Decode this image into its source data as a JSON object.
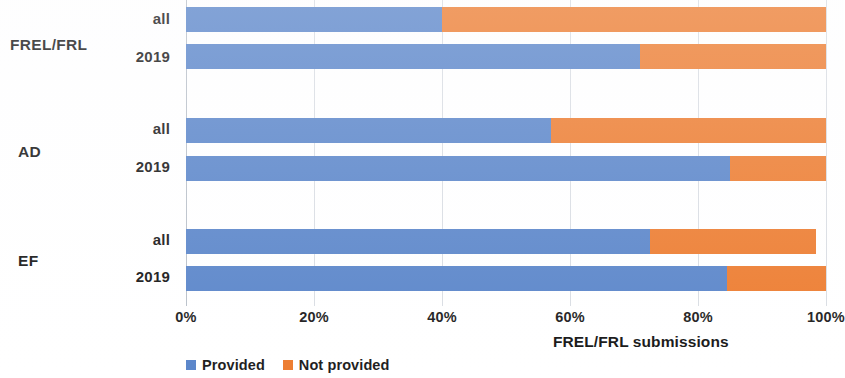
{
  "chart_data": {
    "type": "bar",
    "orientation": "horizontal",
    "stacked": true,
    "stacked_percent": true,
    "title": "",
    "xlabel": "FREL/FRL submissions",
    "ylabel": "",
    "xlim": [
      0,
      100
    ],
    "xticks": [
      "0%",
      "20%",
      "40%",
      "60%",
      "80%",
      "100%"
    ],
    "xtick_values": [
      0,
      20,
      40,
      60,
      80,
      100
    ],
    "grid": true,
    "legend_position": "bottom-left",
    "groups": [
      "FREL/FRL",
      "AD",
      "EF"
    ],
    "subcategories": [
      "all",
      "2019"
    ],
    "categories": [
      "FREL/FRL all",
      "FREL/FRL 2019",
      "AD all",
      "AD 2019",
      "EF all",
      "EF 2019"
    ],
    "series": [
      {
        "name": "Provided",
        "color": "#5b86ca",
        "values": [
          40,
          71,
          57,
          85,
          72.5,
          84.5
        ]
      },
      {
        "name": "Not provided",
        "color": "#ed7d31",
        "values": [
          60,
          29,
          43,
          15,
          26,
          15.5
        ]
      }
    ]
  },
  "axis": {
    "x_title": "FREL/FRL submissions",
    "ticks": [
      {
        "label": "0%",
        "value": 0
      },
      {
        "label": "20%",
        "value": 20
      },
      {
        "label": "40%",
        "value": 40
      },
      {
        "label": "60%",
        "value": 60
      },
      {
        "label": "80%",
        "value": 80
      },
      {
        "label": "100%",
        "value": 100
      }
    ]
  },
  "groups": [
    {
      "name": "FREL/FRL",
      "rows": [
        {
          "label": "all"
        },
        {
          "label": "2019"
        }
      ]
    },
    {
      "name": "AD",
      "rows": [
        {
          "label": "all"
        },
        {
          "label": "2019"
        }
      ]
    },
    {
      "name": "EF",
      "rows": [
        {
          "label": "all"
        },
        {
          "label": "2019"
        }
      ]
    }
  ],
  "legend": {
    "items": [
      {
        "label": "Provided",
        "color": "#5b86ca"
      },
      {
        "label": "Not provided",
        "color": "#ed7d31"
      }
    ]
  },
  "colors": {
    "provided": "#5b86ca",
    "not_provided": "#ed7d31",
    "gridline": "#d9dde3",
    "text": "#1a1a1a",
    "background": "#ffffff"
  }
}
